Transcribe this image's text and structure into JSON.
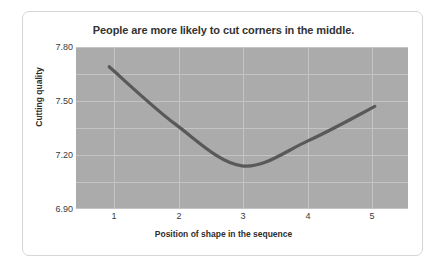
{
  "chart_data": {
    "type": "line",
    "title": "People are more likely to cut corners in the middle.",
    "xlabel": "Position of shape in the sequence",
    "ylabel": "Cutting quality",
    "categories": [
      "1",
      "2",
      "3",
      "4",
      "5"
    ],
    "x": [
      1,
      2,
      3,
      4,
      5
    ],
    "values": [
      7.69,
      7.37,
      7.14,
      7.28,
      7.47
    ],
    "series": [
      {
        "name": "Cutting quality",
        "values": [
          7.69,
          7.37,
          7.14,
          7.28,
          7.47
        ],
        "color": "#595959"
      }
    ],
    "ylim": [
      6.9,
      7.8
    ],
    "xlim": [
      0.5,
      5.5
    ],
    "yticks": [
      6.9,
      7.2,
      7.5,
      7.8
    ],
    "ytick_labels": [
      "6.90",
      "7.20",
      "7.50",
      "7.80"
    ],
    "xticks": [
      1,
      2,
      3,
      4,
      5
    ],
    "xtick_labels": [
      "1",
      "2",
      "3",
      "4",
      "5"
    ],
    "grid": true,
    "legend": "none",
    "plot_background": "#ababab",
    "gridline_color": "#c4c4c4",
    "line_color": "#595959",
    "smoothing": "curved",
    "annotations": []
  }
}
